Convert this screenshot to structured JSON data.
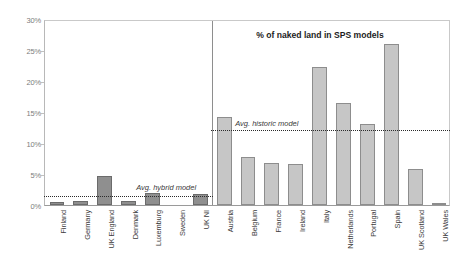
{
  "chart_data": {
    "type": "bar",
    "title": "",
    "xlabel": "",
    "ylabel": "",
    "ylim": [
      0,
      30
    ],
    "grid": false,
    "y_ticks": [
      {
        "value": 30,
        "label": "30%"
      },
      {
        "value": 25,
        "label": "25%"
      },
      {
        "value": 20,
        "label": "20%"
      },
      {
        "value": 15,
        "label": "15%"
      },
      {
        "value": 10,
        "label": "10%"
      },
      {
        "value": 5,
        "label": "5%"
      },
      {
        "value": 0,
        "label": "0%"
      }
    ],
    "panels": [
      {
        "name": "hybrid",
        "title": "",
        "categories": [
          "Finland",
          "Germany",
          "UK England",
          "Denmark",
          "Luxemburg",
          "Sweden",
          "UK NI"
        ],
        "values": [
          0.5,
          0.6,
          4.7,
          0.7,
          2.0,
          0.0,
          1.7
        ],
        "bar_style": "dark",
        "reference_line": {
          "label": "Avg. hybrid model",
          "value": 1.6
        }
      },
      {
        "name": "historic",
        "title": "% of naked land in SPS models",
        "categories": [
          "Austria",
          "Belgium",
          "France",
          "Ireland",
          "Italy",
          "Netherlands",
          "Portugal",
          "Spain",
          "UK Scotland",
          "UK Wales"
        ],
        "values": [
          14.2,
          7.8,
          6.7,
          6.6,
          22.3,
          16.5,
          13.0,
          26.0,
          5.8,
          0.3
        ],
        "bar_style": "light",
        "reference_line": {
          "label": "Avg. historic model",
          "value": 12.2
        }
      }
    ],
    "colors": {
      "bar_dark_fill": "#8f8f8f",
      "bar_dark_stroke": "#6b6b6b",
      "bar_light_fill": "#c6c6c6",
      "bar_light_stroke": "#8d8d8d",
      "reference_line": "#2b2b2b",
      "axis": "#9a9a9a",
      "tick_text": "#7d7d7d",
      "background": "#ffffff"
    }
  }
}
